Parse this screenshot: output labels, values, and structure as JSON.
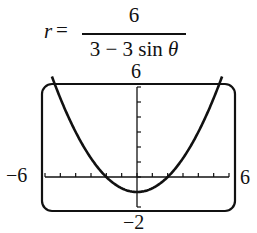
{
  "equation": {
    "lhs": "r",
    "equals": "=",
    "numerator": "6",
    "denominator_prefix": "3 − 3 sin ",
    "denominator_var": "θ"
  },
  "chart_data": {
    "type": "line",
    "xlim": [
      -6,
      6
    ],
    "ylim": [
      -2,
      6
    ],
    "x_tick_step": 1,
    "y_tick_step": 1,
    "grid": false,
    "window_labels": {
      "xmin": "−6",
      "xmax": "6",
      "ymin": "−2",
      "ymax": "6"
    },
    "series": [
      {
        "name": "r = 6/(3 − 3 sin θ)",
        "x": [
          -5.5,
          -5,
          -4,
          -3,
          -2,
          -1,
          0,
          1,
          2,
          3,
          4,
          5,
          5.5
        ],
        "y": [
          6.56,
          5.25,
          3,
          1.25,
          0,
          -0.75,
          -1,
          -0.75,
          0,
          1.25,
          3,
          5.25,
          6.56
        ]
      }
    ],
    "xlabel": "",
    "ylabel": ""
  },
  "colors": {
    "curve": "#111111",
    "frame": "#111111",
    "background": "#ffffff"
  }
}
